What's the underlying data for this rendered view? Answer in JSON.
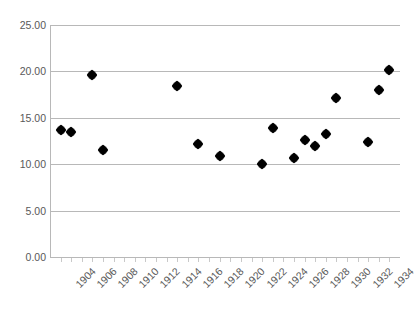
{
  "chart_data": {
    "type": "scatter",
    "title": "",
    "subtitle": "",
    "xlabel": "",
    "ylabel": "",
    "xlim": [
      1903,
      1936
    ],
    "ylim": [
      0,
      25
    ],
    "grid": true,
    "legend": false,
    "legend_position": "none",
    "marker_color": "#000000",
    "gridline_color": "#b8b8b8",
    "tick_label_color": "#595959",
    "background_color": "#ffffff",
    "y_ticks": [
      "0.00",
      "5.00",
      "10.00",
      "15.00",
      "20.00",
      "25.00"
    ],
    "y_tick_values": [
      0,
      5,
      10,
      15,
      20,
      25
    ],
    "x_ticks": [
      "1904",
      "1906",
      "1908",
      "1910",
      "1912",
      "1914",
      "1916",
      "1918",
      "1920",
      "1922",
      "1924",
      "1926",
      "1928",
      "1930",
      "1932",
      "1934"
    ],
    "x_tick_values": [
      1904,
      1906,
      1908,
      1910,
      1912,
      1914,
      1916,
      1918,
      1920,
      1922,
      1924,
      1926,
      1928,
      1930,
      1932,
      1934
    ],
    "x": [
      1904,
      1905,
      1907,
      1908,
      1915,
      1917,
      1919,
      1923,
      1924,
      1926,
      1927,
      1928,
      1929,
      1930,
      1933,
      1934,
      1935
    ],
    "y": [
      13.7,
      13.5,
      19.6,
      11.5,
      18.4,
      12.2,
      10.9,
      10.0,
      13.9,
      10.7,
      12.6,
      12.0,
      13.3,
      17.1,
      12.4,
      18.0,
      20.2
    ],
    "points": [
      {
        "x": 1904,
        "y": 13.7
      },
      {
        "x": 1905,
        "y": 13.5
      },
      {
        "x": 1907,
        "y": 19.6
      },
      {
        "x": 1908,
        "y": 11.5
      },
      {
        "x": 1915,
        "y": 18.4
      },
      {
        "x": 1917,
        "y": 12.2
      },
      {
        "x": 1919,
        "y": 10.9
      },
      {
        "x": 1923,
        "y": 10.0
      },
      {
        "x": 1924,
        "y": 13.9
      },
      {
        "x": 1926,
        "y": 10.7
      },
      {
        "x": 1927,
        "y": 12.6
      },
      {
        "x": 1928,
        "y": 12.0
      },
      {
        "x": 1929,
        "y": 13.3
      },
      {
        "x": 1930,
        "y": 17.1
      },
      {
        "x": 1933,
        "y": 12.4
      },
      {
        "x": 1934,
        "y": 18.0
      },
      {
        "x": 1935,
        "y": 20.2
      }
    ]
  }
}
